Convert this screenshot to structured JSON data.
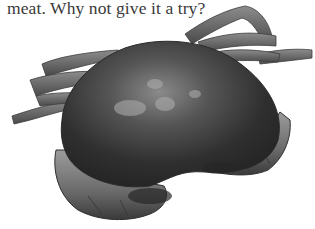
{
  "document": {
    "text_fragment": "meat. Why not give it a try?",
    "image": {
      "subject": "crab-photo",
      "style": "grayscale",
      "background": "#ffffff"
    }
  },
  "colors": {
    "text": "#3a3a3a",
    "shell_dark": "#2e2e2e",
    "shell_mid": "#5a5a5a",
    "shell_light": "#9a9a9a",
    "leg": "#6e6e6e"
  }
}
